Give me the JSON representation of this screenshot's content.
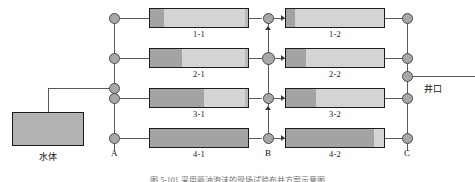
{
  "diagram": {
    "title_caption": "图 5-101  采用驱油泡沫的现场试验布井方案示意图",
    "water_body": {
      "label": "水体"
    },
    "wellhead": {
      "label": "井口"
    },
    "columns": [
      {
        "id": "A",
        "label": "A"
      },
      {
        "id": "B",
        "label": "B"
      },
      {
        "id": "C",
        "label": "C"
      }
    ],
    "rows": [
      {
        "index": 1,
        "left_label": "1-1",
        "right_label": "1-2",
        "left_fill_pct": 14,
        "right_fill_pct": 9
      },
      {
        "index": 2,
        "left_label": "2-1",
        "right_label": "2-2",
        "left_fill_pct": 33,
        "right_fill_pct": 20
      },
      {
        "index": 3,
        "left_label": "3-1",
        "right_label": "3-2",
        "left_fill_pct": 55,
        "right_fill_pct": 31
      },
      {
        "index": 4,
        "left_label": "4-1",
        "right_label": "4-2",
        "left_fill_pct": 100,
        "right_fill_pct": 90
      }
    ],
    "colors": {
      "bar_light": "#d4d4d4",
      "bar_dark": "#a3a3a3",
      "bar_border": "#1c1c1c",
      "node_fill": "#a8a8a8",
      "node_border": "#4a4a4a",
      "line": "#5a5a5a",
      "tank_fill": "#b2b2b2",
      "background": "#ffffff"
    }
  }
}
